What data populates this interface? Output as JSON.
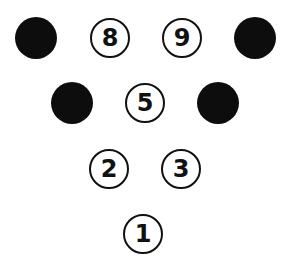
{
  "diagram": {
    "type": "bowling-pin-layout",
    "pins": [
      {
        "id": "pin-7",
        "state": "knocked",
        "label": "",
        "x": 36,
        "y": 38
      },
      {
        "id": "pin-8",
        "state": "standing",
        "label": "8",
        "x": 110,
        "y": 38
      },
      {
        "id": "pin-9",
        "state": "standing",
        "label": "9",
        "x": 182,
        "y": 38
      },
      {
        "id": "pin-10",
        "state": "knocked",
        "label": "",
        "x": 255,
        "y": 38
      },
      {
        "id": "pin-4",
        "state": "knocked",
        "label": "",
        "x": 72,
        "y": 103
      },
      {
        "id": "pin-5",
        "state": "standing",
        "label": "5",
        "x": 145,
        "y": 103
      },
      {
        "id": "pin-6",
        "state": "knocked",
        "label": "",
        "x": 218,
        "y": 103
      },
      {
        "id": "pin-2",
        "state": "standing",
        "label": "2",
        "x": 109,
        "y": 169
      },
      {
        "id": "pin-3",
        "state": "standing",
        "label": "3",
        "x": 181,
        "y": 169
      },
      {
        "id": "pin-1",
        "state": "standing",
        "label": "1",
        "x": 143,
        "y": 234
      }
    ],
    "colors": {
      "knocked": "#0d0d0d",
      "standing_border": "#111111",
      "background": "#ffffff"
    }
  }
}
